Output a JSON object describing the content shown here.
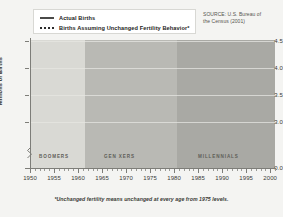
{
  "legend": {
    "items": [
      {
        "label": "Actual Births",
        "style": "solid",
        "swatch": "solid-line-swatch"
      },
      {
        "label": "Births Assuming Unchanged Fertility Behavior*",
        "style": "dotted",
        "swatch": "dotted-line-swatch"
      }
    ]
  },
  "source": {
    "line1": "SOURCE: U.S. Bureau of",
    "line2": "the Census (2001)"
  },
  "footnote": "*Unchanged fertility means unchanged at every age from 1975 levels.",
  "bands": [
    {
      "name": "BOOMERS",
      "start": 1946,
      "end": 1964,
      "color": "#d9d9d4"
    },
    {
      "name": "GEN XERS",
      "start": 1964,
      "end": 1980,
      "color": "#b9b9b4"
    },
    {
      "name": "MILLENNIALS",
      "start": 1980,
      "end": 2001,
      "color": "#a9a9a4"
    }
  ],
  "chart_data": {
    "type": "line",
    "title": "",
    "xlabel": "",
    "ylabel": "Millions of Births",
    "xlim": [
      1950,
      2001
    ],
    "ylim": [
      2.85,
      4.5
    ],
    "yticks": [
      4.5,
      4.0,
      3.5,
      3.0,
      0.0
    ],
    "ytick_labels": [
      "4.5",
      "4.0",
      "3.5",
      "3.0",
      "0.0"
    ],
    "y_axis_break": true,
    "xticks": [
      1950,
      1955,
      1960,
      1965,
      1970,
      1975,
      1980,
      1985,
      1990,
      1995,
      2000
    ],
    "xtick_labels": [
      "1950",
      "1955",
      "1960",
      "1965",
      "1970",
      "1975",
      "1980",
      "1985",
      "1990",
      "1995",
      "2000"
    ],
    "minor_xtick_step": 1,
    "grid": true,
    "legend_position": "top-left-box",
    "series": [
      {
        "name": "Actual Births",
        "style": "solid",
        "color": "#4a4a48",
        "x": [
          1950,
          1951,
          1952,
          1953,
          1954,
          1955,
          1956,
          1957,
          1958,
          1959,
          1960,
          1961,
          1962,
          1963,
          1964,
          1965,
          1966,
          1967,
          1968,
          1969,
          1970,
          1971,
          1972,
          1973,
          1974,
          1975,
          1976,
          1977,
          1978,
          1979,
          1980,
          1981,
          1982,
          1983,
          1984,
          1985,
          1986,
          1987,
          1988,
          1989,
          1990,
          1991,
          1992,
          1993,
          1994,
          1995,
          1996,
          1997,
          1998,
          1999,
          2000
        ],
        "values": [
          3.63,
          3.82,
          3.91,
          3.97,
          4.08,
          4.1,
          4.22,
          4.31,
          4.26,
          4.3,
          4.26,
          4.27,
          4.17,
          4.1,
          4.03,
          3.76,
          3.61,
          3.52,
          3.5,
          3.6,
          3.73,
          3.56,
          3.26,
          3.14,
          3.16,
          3.14,
          3.17,
          3.33,
          3.33,
          3.49,
          3.61,
          3.63,
          3.68,
          3.64,
          3.67,
          3.76,
          3.76,
          3.81,
          3.91,
          4.04,
          4.16,
          4.11,
          4.07,
          4.0,
          3.95,
          3.9,
          3.89,
          3.88,
          3.94,
          3.96,
          4.06
        ]
      },
      {
        "name": "Births Assuming Unchanged Fertility Behavior*",
        "style": "dotted",
        "color": "#2b2b2b",
        "x": [
          1975,
          1976,
          1977,
          1978,
          1979,
          1980,
          1981,
          1982,
          1983,
          1984,
          1985,
          1986,
          1987,
          1988,
          1989,
          1990,
          1991,
          1992,
          1993,
          1994,
          1995,
          1996,
          1997,
          1998,
          1999,
          2000
        ],
        "values": [
          3.14,
          3.17,
          3.23,
          3.3,
          3.38,
          3.46,
          3.52,
          3.56,
          3.58,
          3.6,
          3.61,
          3.6,
          3.58,
          3.56,
          3.53,
          3.5,
          3.47,
          3.44,
          3.41,
          3.38,
          3.36,
          3.36,
          3.37,
          3.4,
          3.44,
          3.48
        ]
      }
    ]
  }
}
